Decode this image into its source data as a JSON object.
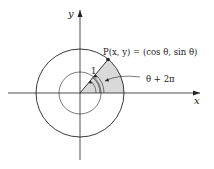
{
  "diagram": {
    "axes": {
      "x_label": "x",
      "y_label": "y"
    },
    "point_label": "P(x, y) = (cos θ, sin θ)",
    "radius_label": "1",
    "angle_label": "θ + 2π",
    "colors": {
      "shade": "#d9d9d9",
      "stroke": "#222222",
      "background": "#ffffff"
    }
  }
}
